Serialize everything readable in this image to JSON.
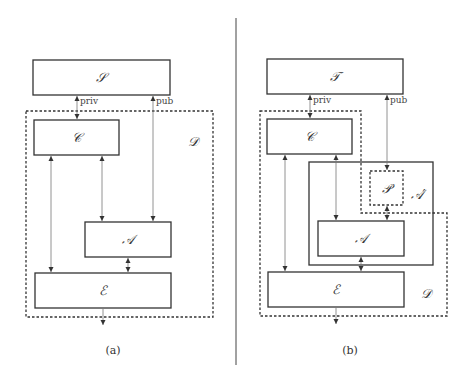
{
  "panels": [
    {
      "caption": "(a)",
      "nodes": {
        "top": "𝒮",
        "c": "𝒞",
        "a": "𝒜",
        "e": "ℰ",
        "d": "𝒟"
      },
      "edges": {
        "priv": "priv",
        "pub": "pub"
      }
    },
    {
      "caption": "(b)",
      "nodes": {
        "top": "𝒯",
        "c": "𝒞",
        "p": "𝒫",
        "a_prime": "𝒜′",
        "a": "𝒜",
        "e": "ℰ",
        "d": "𝒟"
      },
      "edges": {
        "priv": "priv",
        "pub": "pub"
      }
    }
  ]
}
